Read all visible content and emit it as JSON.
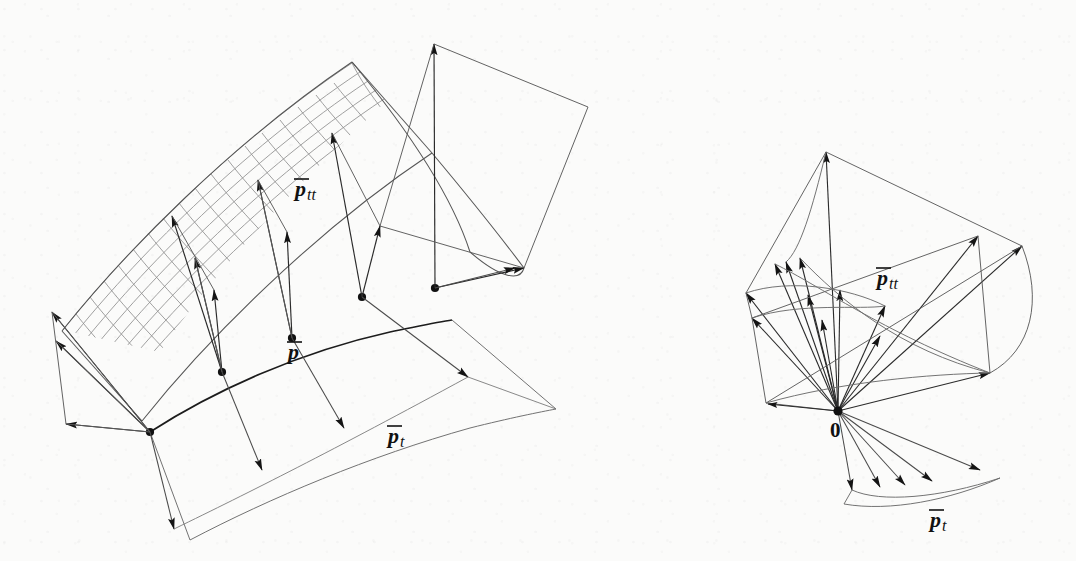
{
  "figure": {
    "background_color": "#fbfbfa",
    "ink_color": "#1a1a1a",
    "mesh_color": "#8d8d8d",
    "line_color": "#4a4a4a",
    "width": 1076,
    "height": 561
  },
  "panels": [
    {
      "id": "left-panel",
      "name": "surface-with-attached-vectors",
      "description": "Curved parametric surface patch drawn as a fine quadrilateral mesh, with a highlighted parameter curve carrying five marked base points; at each base point the second-derivative vectors p-tt point up into the surface and the tangent vectors p-t point down-right onto a lower sheet.",
      "labels": [
        {
          "id": "left-ptt",
          "text_main": "p",
          "text_sub": "tt",
          "overline": true,
          "x": 295,
          "y": 196,
          "font_size": 22
        },
        {
          "id": "left-p",
          "text_main": "p",
          "text_sub": "",
          "overline": true,
          "x": 288,
          "y": 359,
          "font_size": 22
        },
        {
          "id": "left-pt",
          "text_main": "p",
          "text_sub": "t",
          "overline": true,
          "x": 388,
          "y": 443,
          "font_size": 22
        }
      ],
      "base_points": 5,
      "ptt_vectors": 5,
      "pt_vectors": 5
    },
    {
      "id": "right-panel",
      "name": "vector-fan-at-origin",
      "description": "The same vector families translated to a common origin marked 0; an upper fan of p-tt vectors whose tips trace a curve, and a lower fan of p-t vectors whose tips trace a second curve.",
      "labels": [
        {
          "id": "right-ptt",
          "text_main": "p",
          "text_sub": "tt",
          "overline": true,
          "x": 877,
          "y": 285,
          "font_size": 22
        },
        {
          "id": "right-origin",
          "text_main": "0",
          "text_sub": "",
          "overline": false,
          "bold": true,
          "x": 830,
          "y": 437,
          "font_size": 21
        },
        {
          "id": "right-pt",
          "text_main": "p",
          "text_sub": "t",
          "overline": true,
          "x": 930,
          "y": 527,
          "font_size": 22
        }
      ],
      "origin": {
        "x": 838,
        "y": 411
      },
      "ptt_vectors": 11,
      "pt_vectors": 5
    }
  ],
  "glyphs": {
    "arrow_head": "solid-black-narrow-triangle",
    "point_marker": "filled-black-disc"
  }
}
